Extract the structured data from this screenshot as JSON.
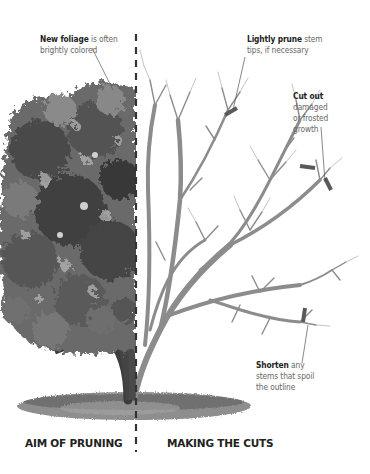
{
  "annotations": {
    "new_foliage": {
      "bold": "New foliage",
      "rest": " is often",
      "line2": "brightly colored"
    },
    "lightly_prune": {
      "bold": "Lightly prune",
      "rest": " stem",
      "line2": "tips, if necessary"
    },
    "cut_out": {
      "bold": "Cut out",
      "line2": "damaged",
      "line3": "or frosted",
      "line4": "growth"
    },
    "shorten": {
      "bold": "Shorten",
      "rest": " any",
      "line2": "stems that spoil",
      "line3": "the outline"
    }
  },
  "sections": {
    "left": "AIM OF PRUNING",
    "right": "MAKING THE CUTS"
  },
  "colors": {
    "foliage_dark": "#3a3a3a",
    "foliage_mid": "#6e6e6e",
    "foliage_light": "#9a9a9a",
    "branch": "#8a8a8a",
    "trunk": "#555555",
    "cut_mark": "#5a5a5a",
    "text_bold": "#222222",
    "text": "#666666"
  }
}
